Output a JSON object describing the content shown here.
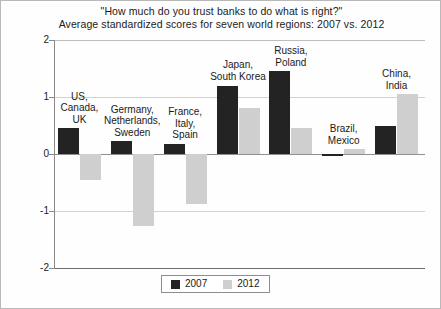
{
  "chart_data": {
    "type": "bar",
    "title": "\"How much do you trust banks to do what is right?\"",
    "subtitle": "Average standardized scores for seven world regions: 2007 vs. 2012",
    "xlabel": "",
    "ylabel": "",
    "ylim": [
      -2,
      2
    ],
    "yticks": [
      "2",
      "1",
      "0",
      "-1",
      "-2"
    ],
    "ytick_values": [
      2,
      1,
      0,
      -1,
      -2
    ],
    "grid": true,
    "legend_position": "bottom-center",
    "categories": [
      "US,\nCanada,\nUK",
      "Germany,\nNetherlands,\nSweden",
      "France,\nItaly,\nSpain",
      "Japan,\nSouth Korea",
      "Russia,\nPoland",
      "Brazil,\nMexico",
      "China,\nIndia"
    ],
    "series": [
      {
        "name": "2007",
        "color": "#232323",
        "values": [
          0.45,
          0.22,
          0.18,
          1.2,
          1.45,
          -0.02,
          0.5
        ]
      },
      {
        "name": "2012",
        "color": "#cfcfcf",
        "values": [
          -0.45,
          -1.27,
          -0.87,
          0.8,
          0.45,
          0.08,
          1.05
        ]
      }
    ]
  },
  "chart": {
    "title": "\"How much do you trust banks to do what is right?\"",
    "subtitle": "Average standardized scores for seven world regions: 2007 vs. 2012",
    "yticks": [
      {
        "label": "2",
        "value": 2
      },
      {
        "label": "1",
        "value": 1
      },
      {
        "label": "0",
        "value": 0
      },
      {
        "label": "-1",
        "value": -1
      },
      {
        "label": "-2",
        "value": -2
      }
    ],
    "groups": [
      {
        "label_lines": [
          "US,",
          "Canada,",
          "UK"
        ],
        "v2007": 0.45,
        "v2012": -0.45
      },
      {
        "label_lines": [
          "Germany,",
          "Netherlands,",
          "Sweden"
        ],
        "v2007": 0.22,
        "v2012": -1.27
      },
      {
        "label_lines": [
          "France,",
          "Italy,",
          "Spain"
        ],
        "v2007": 0.18,
        "v2012": -0.87
      },
      {
        "label_lines": [
          "Japan,",
          "South Korea"
        ],
        "v2007": 1.2,
        "v2012": 0.8
      },
      {
        "label_lines": [
          "Russia,",
          "Poland"
        ],
        "v2007": 1.45,
        "v2012": 0.45
      },
      {
        "label_lines": [
          "Brazil,",
          "Mexico"
        ],
        "v2007": -0.02,
        "v2012": 0.08
      },
      {
        "label_lines": [
          "China,",
          "India"
        ],
        "v2007": 0.5,
        "v2012": 1.05
      }
    ],
    "legend": [
      {
        "label": "2007",
        "color": "#232323"
      },
      {
        "label": "2012",
        "color": "#cfcfcf"
      }
    ]
  }
}
